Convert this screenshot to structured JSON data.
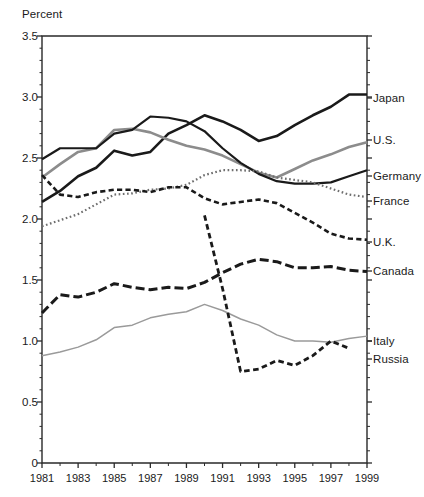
{
  "chart_data": {
    "type": "line",
    "title": "",
    "ylabel": "Percent",
    "xlabel": "",
    "ylim": [
      0,
      3.5
    ],
    "xlim": [
      1981,
      1999
    ],
    "grid": false,
    "legend_position": "right-of-axis",
    "y_ticks": [
      "0",
      "0.5",
      "1.0",
      "1.5",
      "2.0",
      "2.5",
      "3.0",
      "3.5"
    ],
    "y_tick_values": [
      0,
      0.5,
      1.0,
      1.5,
      2.0,
      2.5,
      3.0,
      3.5
    ],
    "y_minor_step": 0.1,
    "x_ticks": [
      "1981",
      "1983",
      "1985",
      "1987",
      "1989",
      "1991",
      "1993",
      "1995",
      "1997",
      "1999"
    ],
    "x_tick_values": [
      1981,
      1983,
      1985,
      1987,
      1989,
      1991,
      1993,
      1995,
      1997,
      1999
    ],
    "x": [
      1981,
      1982,
      1983,
      1984,
      1985,
      1986,
      1987,
      1988,
      1989,
      1990,
      1991,
      1992,
      1993,
      1994,
      1995,
      1996,
      1997,
      1998,
      1999
    ],
    "series": [
      {
        "name": "Japan",
        "color": "#1a1a1a",
        "style": "solid",
        "width": 2.6,
        "label_value": 3.02,
        "values": [
          2.14,
          2.23,
          2.35,
          2.42,
          2.56,
          2.52,
          2.55,
          2.7,
          2.77,
          2.85,
          2.8,
          2.73,
          2.64,
          2.68,
          2.77,
          2.85,
          2.92,
          3.02,
          3.02
        ]
      },
      {
        "name": "U.S.",
        "color": "#8c8c8c",
        "style": "solid",
        "width": 2.6,
        "label_value": 2.63,
        "values": [
          2.34,
          2.45,
          2.55,
          2.58,
          2.73,
          2.74,
          2.71,
          2.65,
          2.6,
          2.57,
          2.52,
          2.45,
          2.38,
          2.34,
          2.41,
          2.48,
          2.53,
          2.59,
          2.63
        ]
      },
      {
        "name": "Germany",
        "color": "#1a1a1a",
        "style": "solid",
        "width": 2.2,
        "label_value": 2.4,
        "values": [
          2.49,
          2.58,
          2.58,
          2.58,
          2.7,
          2.73,
          2.84,
          2.83,
          2.8,
          2.72,
          2.58,
          2.46,
          2.37,
          2.31,
          2.29,
          2.29,
          2.3,
          2.35,
          2.4
        ]
      },
      {
        "name": "France",
        "color": "#6e6e6e",
        "style": "dotted",
        "width": 2.2,
        "label_value": 2.18,
        "values": [
          1.94,
          1.99,
          2.04,
          2.12,
          2.2,
          2.21,
          2.24,
          2.25,
          2.28,
          2.36,
          2.4,
          2.4,
          2.39,
          2.34,
          2.32,
          2.3,
          2.25,
          2.2,
          2.18
        ]
      },
      {
        "name": "U.K.",
        "color": "#1a1a1a",
        "style": "dashed",
        "width": 2.6,
        "label_value": 1.83,
        "values": [
          2.36,
          2.2,
          2.18,
          2.22,
          2.24,
          2.24,
          2.22,
          2.26,
          2.26,
          2.17,
          2.12,
          2.14,
          2.16,
          2.13,
          2.05,
          1.97,
          1.88,
          1.84,
          1.83
        ]
      },
      {
        "name": "Canada",
        "color": "#1a1a1a",
        "style": "long-dash",
        "width": 3.0,
        "label_value": 1.57,
        "values": [
          1.23,
          1.38,
          1.36,
          1.4,
          1.47,
          1.44,
          1.42,
          1.44,
          1.43,
          1.48,
          1.56,
          1.63,
          1.67,
          1.65,
          1.6,
          1.6,
          1.61,
          1.58,
          1.57
        ]
      },
      {
        "name": "Italy",
        "color": "#9a9a9a",
        "style": "solid",
        "width": 1.5,
        "label_value": 1.04,
        "values": [
          0.88,
          0.91,
          0.95,
          1.01,
          1.11,
          1.13,
          1.19,
          1.22,
          1.24,
          1.3,
          1.25,
          1.18,
          1.13,
          1.05,
          1.0,
          1.0,
          0.99,
          1.02,
          1.04
        ]
      },
      {
        "name": "Russia",
        "color": "#1a1a1a",
        "style": "dashed",
        "width": 2.8,
        "label_value": 0.94,
        "values": [
          null,
          null,
          null,
          null,
          null,
          null,
          null,
          null,
          null,
          2.03,
          1.43,
          0.75,
          0.77,
          0.84,
          0.8,
          0.88,
          1.0,
          0.94,
          null
        ]
      }
    ]
  },
  "legend": {
    "entries": [
      {
        "label": "Japan"
      },
      {
        "label": "U.S."
      },
      {
        "label": "Germany"
      },
      {
        "label": "France"
      },
      {
        "label": "U.K."
      },
      {
        "label": "Canada"
      },
      {
        "label": "Italy"
      },
      {
        "label": "Russia"
      }
    ]
  },
  "legend_positions_px": [
    98,
    140,
    176,
    201,
    242,
    271,
    341,
    359
  ],
  "axes": {
    "plot_left_px": 42,
    "plot_right_px": 367,
    "plot_top_px": 36,
    "plot_bottom_px": 463,
    "axis_color": "#2a2a2a"
  }
}
